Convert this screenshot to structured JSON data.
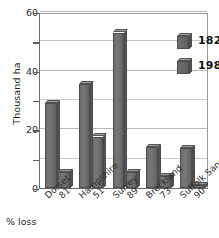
{
  "chart_data": {
    "type": "bar",
    "title": "",
    "xlabel": "% loss",
    "ylabel": "Thousand ha",
    "ylim": [
      0,
      60
    ],
    "yticks": [
      0,
      20,
      40,
      60
    ],
    "yticks_minor": [
      10,
      30,
      50
    ],
    "grid": true,
    "legend_position": "top-right",
    "categories": [
      "Dorset",
      "Hampshire",
      "Surrey",
      "Breckland",
      "Suffolk Sandlings"
    ],
    "percent_loss": [
      "81",
      "51",
      "89",
      "73",
      "90"
    ],
    "series": [
      {
        "name": "1820s",
        "values": [
          29,
          35.5,
          53,
          14,
          13.5
        ]
      },
      {
        "name": "1980s",
        "values": [
          5.5,
          17.5,
          5.5,
          4,
          1
        ]
      }
    ]
  },
  "axis": {
    "y_title": "Thousand ha",
    "y_labels": [
      "60",
      "40",
      "20",
      "0"
    ],
    "x_footnote": "% loss",
    "x_items": [
      {
        "name": "Dorset",
        "loss": "81"
      },
      {
        "name": "Hampshire",
        "loss": "51"
      },
      {
        "name": "Surrey",
        "loss": "89"
      },
      {
        "name": "Breckland",
        "loss": "73"
      },
      {
        "name": "Suffolk Sandlings",
        "loss": "90"
      }
    ]
  },
  "legend": {
    "entries": [
      {
        "label": "1820s"
      },
      {
        "label": "1980s"
      }
    ]
  },
  "colors": {
    "bar_face": "#6d6d6d",
    "bar_top": "#9b9b9b",
    "bar_side": "#565656",
    "grid": "#b9b9b9",
    "axis": "#5d5d5d",
    "text": "#1f1f1f",
    "background": "#ffffff"
  }
}
